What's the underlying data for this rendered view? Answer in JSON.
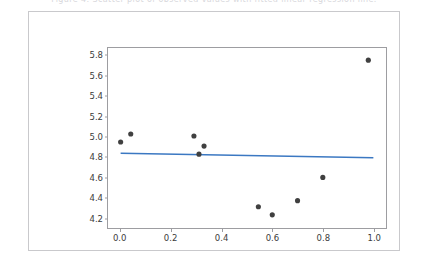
{
  "top_caption": {
    "text": "Figure 4: Scatter plot of observed values with fitted linear regression line."
  },
  "figure": {
    "background_color": "#ffffff",
    "border_color": "#c9c9cc",
    "axes_color": "#9d9da1",
    "point_color": "#404040",
    "line_color": "#3b78c2"
  },
  "chart_data": {
    "type": "scatter",
    "title": "",
    "xlabel": "",
    "ylabel": "",
    "xlim": [
      -0.05,
      1.05
    ],
    "ylim": [
      4.1,
      5.88
    ],
    "grid": false,
    "legend": null,
    "xticks": [
      "0.0",
      "0.2",
      "0.4",
      "0.6",
      "0.8",
      "1.0"
    ],
    "xtick_values": [
      0.0,
      0.2,
      0.4,
      0.6,
      0.8,
      1.0
    ],
    "yticks": [
      "4.2",
      "4.4",
      "4.6",
      "4.8",
      "5.0",
      "5.2",
      "5.4",
      "5.6",
      "5.8"
    ],
    "ytick_values": [
      4.2,
      4.4,
      4.6,
      4.8,
      5.0,
      5.2,
      5.4,
      5.6,
      5.8
    ],
    "points": [
      {
        "x": 0.0,
        "y": 4.95
      },
      {
        "x": 0.04,
        "y": 5.03
      },
      {
        "x": 0.29,
        "y": 5.01
      },
      {
        "x": 0.31,
        "y": 4.83
      },
      {
        "x": 0.33,
        "y": 4.91
      },
      {
        "x": 0.545,
        "y": 4.31
      },
      {
        "x": 0.6,
        "y": 4.23
      },
      {
        "x": 0.7,
        "y": 4.37
      },
      {
        "x": 0.8,
        "y": 4.6
      },
      {
        "x": 0.98,
        "y": 5.76
      }
    ],
    "marker": {
      "shape": "circle",
      "size": 5.2,
      "color": "#404040"
    },
    "series": [
      {
        "name": "fit",
        "type": "line",
        "color": "#3b78c2",
        "width": 1.6,
        "x": [
          0.0,
          1.0
        ],
        "values": [
          4.84,
          4.795
        ]
      }
    ]
  }
}
